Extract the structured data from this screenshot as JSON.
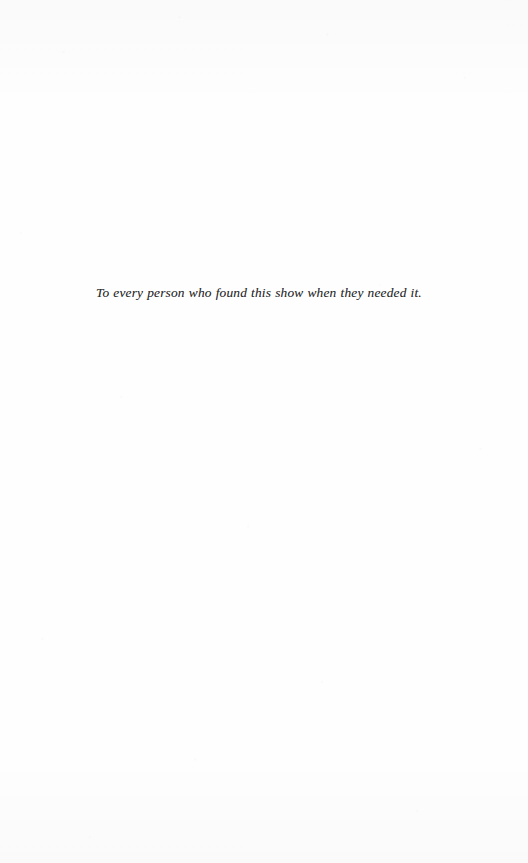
{
  "page": {
    "kind": "book-dedication-page",
    "background_color": "#fefefe",
    "ink_color": "#2b2b2b",
    "width": 528,
    "height": 863
  },
  "dedication": {
    "text": "To every person who found this show when they needed it."
  }
}
